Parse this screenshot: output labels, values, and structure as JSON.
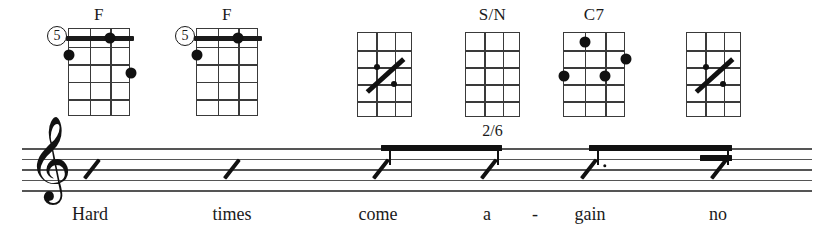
{
  "page": {
    "width": 829,
    "height": 235,
    "background": "#ffffff",
    "ink": "#111111",
    "staff_color": "#555555"
  },
  "chords": [
    {
      "name": "F",
      "position_marker": "5",
      "sublabel": "",
      "x": 68,
      "y": 28,
      "width": 62,
      "height": 88,
      "strings": 4,
      "frets": 5,
      "barre": {
        "fret": 1,
        "from_string": 1,
        "to_string": 4
      },
      "dots": [
        {
          "string": 3,
          "fret": 1
        },
        {
          "string": 1,
          "fret": 2
        },
        {
          "string": 4,
          "fret": 3
        }
      ],
      "repeat_symbol": false
    },
    {
      "name": "F",
      "position_marker": "5",
      "sublabel": "",
      "x": 196,
      "y": 28,
      "width": 62,
      "height": 88,
      "strings": 4,
      "frets": 5,
      "barre": {
        "fret": 1,
        "from_string": 1,
        "to_string": 4
      },
      "dots": [
        {
          "string": 3,
          "fret": 1
        },
        {
          "string": 1,
          "fret": 2
        }
      ],
      "repeat_symbol": false
    },
    {
      "name": "",
      "position_marker": "",
      "sublabel": "",
      "x": 357,
      "y": 32,
      "width": 55,
      "height": 85,
      "strings": 4,
      "frets": 5,
      "barre": null,
      "dots": [],
      "repeat_symbol": true
    },
    {
      "name": "S/N",
      "position_marker": "",
      "sublabel": "2/6",
      "x": 465,
      "y": 32,
      "width": 55,
      "height": 85,
      "strings": 4,
      "frets": 5,
      "barre": null,
      "dots": [],
      "repeat_symbol": false
    },
    {
      "name": "C7",
      "position_marker": "",
      "sublabel": "",
      "x": 563,
      "y": 32,
      "width": 62,
      "height": 85,
      "strings": 4,
      "frets": 5,
      "barre": null,
      "dots": [
        {
          "string": 2,
          "fret": 1
        },
        {
          "string": 4,
          "fret": 2
        },
        {
          "string": 3,
          "fret": 3
        },
        {
          "string": 1,
          "fret": 3
        }
      ],
      "repeat_symbol": false
    },
    {
      "name": "",
      "position_marker": "",
      "sublabel": "",
      "x": 686,
      "y": 32,
      "width": 55,
      "height": 85,
      "strings": 4,
      "frets": 5,
      "barre": null,
      "dots": [],
      "repeat_symbol": true
    }
  ],
  "staff": {
    "left": 22,
    "right": 812,
    "top": 148,
    "line_gap": 10.5,
    "lines": 5,
    "clef": "treble-clef",
    "clef_glyph": "𝄞"
  },
  "notes": [
    {
      "id": "note-1",
      "type": "slash",
      "duration": "quarter",
      "x": 92,
      "beam_group": null,
      "dotted": false
    },
    {
      "id": "note-2",
      "type": "slash",
      "duration": "quarter",
      "x": 232,
      "beam_group": null,
      "dotted": false
    },
    {
      "id": "note-3",
      "type": "slash",
      "duration": "eighth",
      "x": 381,
      "beam_group": 1,
      "dotted": false
    },
    {
      "id": "note-4",
      "type": "slash",
      "duration": "eighth",
      "x": 489,
      "beam_group": 1,
      "dotted": false
    },
    {
      "id": "note-5",
      "type": "slash",
      "duration": "dotted-eighth",
      "x": 589,
      "beam_group": 2,
      "dotted": true
    },
    {
      "id": "note-6",
      "type": "slash",
      "duration": "sixteenth",
      "x": 719,
      "beam_group": 2,
      "dotted": false
    }
  ],
  "beams": [
    {
      "id": "beam-1",
      "from_x": 381,
      "to_x": 492,
      "y": 145,
      "thickness": 6,
      "secondary": false
    },
    {
      "id": "beam-2",
      "from_x": 589,
      "to_x": 722,
      "y": 145,
      "thickness": 6,
      "secondary": false
    },
    {
      "id": "beam-2b",
      "from_x": 700,
      "to_x": 722,
      "y": 155,
      "thickness": 6,
      "secondary": true
    }
  ],
  "lyrics": [
    {
      "text": "Hard",
      "x": 90
    },
    {
      "text": "times",
      "x": 232
    },
    {
      "text": "come",
      "x": 378
    },
    {
      "text": "a",
      "x": 487
    },
    {
      "text": "-",
      "x": 535
    },
    {
      "text": "gain",
      "x": 590
    },
    {
      "text": "no",
      "x": 718
    }
  ]
}
